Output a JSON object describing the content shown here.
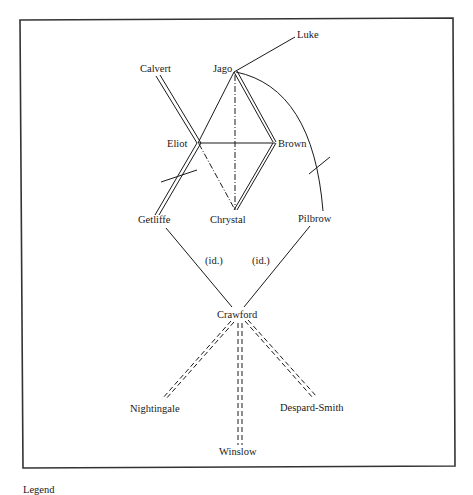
{
  "diagram": {
    "title": "",
    "legend_label": "Legend",
    "nodes": [
      {
        "id": "luke",
        "label": "Luke"
      },
      {
        "id": "calvert",
        "label": "Calvert"
      },
      {
        "id": "jago",
        "label": "Jago"
      },
      {
        "id": "eliot",
        "label": "Eliot"
      },
      {
        "id": "brown",
        "label": "Brown"
      },
      {
        "id": "getliffe",
        "label": "Getliffe"
      },
      {
        "id": "chrystal",
        "label": "Chrystal"
      },
      {
        "id": "pilbrow",
        "label": "Pilbrow"
      },
      {
        "id": "crawford",
        "label": "Crawford"
      },
      {
        "id": "nightingale",
        "label": "Nightingale"
      },
      {
        "id": "winslow",
        "label": "Winslow"
      },
      {
        "id": "despard_smith",
        "label": "Despard-Smith"
      }
    ],
    "edge_labels": {
      "getliffe_crawford": "(id.)",
      "pilbrow_crawford": "(id.)"
    },
    "edges": [
      {
        "from": "jago",
        "to": "luke",
        "style": "single"
      },
      {
        "from": "calvert",
        "to": "getliffe",
        "style": "double",
        "via": "eliot",
        "crossed": true
      },
      {
        "from": "jago",
        "to": "eliot",
        "style": "single"
      },
      {
        "from": "jago",
        "to": "brown",
        "style": "double"
      },
      {
        "from": "eliot",
        "to": "brown",
        "style": "single"
      },
      {
        "from": "jago",
        "to": "chrystal",
        "style": "dash-dot"
      },
      {
        "from": "eliot",
        "to": "chrystal",
        "style": "dash-dot"
      },
      {
        "from": "brown",
        "to": "chrystal",
        "style": "double"
      },
      {
        "from": "jago",
        "to": "pilbrow",
        "style": "single-arc",
        "crossed": true
      },
      {
        "from": "getliffe",
        "to": "crawford",
        "style": "single",
        "label": "(id.)"
      },
      {
        "from": "pilbrow",
        "to": "crawford",
        "style": "single",
        "label": "(id.)"
      },
      {
        "from": "crawford",
        "to": "nightingale",
        "style": "double-dashed"
      },
      {
        "from": "crawford",
        "to": "winslow",
        "style": "double-dashed"
      },
      {
        "from": "crawford",
        "to": "despard_smith",
        "style": "double-dashed"
      }
    ]
  }
}
